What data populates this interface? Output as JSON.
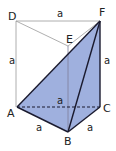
{
  "figure": {
    "type": "triangular prism with shaded section",
    "colors": {
      "fill": "#9fb0de",
      "thin_edge": "#9a9a9a",
      "bold_edge": "#1a1a2e"
    },
    "vertices": {
      "D": {
        "label": "D"
      },
      "E": {
        "label": "E"
      },
      "F": {
        "label": "F"
      },
      "A": {
        "label": "A"
      },
      "B": {
        "label": "B"
      },
      "C": {
        "label": "C"
      }
    },
    "edge_labels": {
      "DF": "a",
      "AD": "a",
      "CF": "a",
      "AC": "a",
      "AB": "a",
      "BC": "a"
    }
  }
}
